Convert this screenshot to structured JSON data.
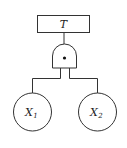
{
  "diagram": {
    "type": "fault-tree",
    "top_event": {
      "label": "T"
    },
    "gate": {
      "type": "AND",
      "symbol": "•"
    },
    "basic_events": [
      {
        "label": "X",
        "subscript": "1"
      },
      {
        "label": "X",
        "subscript": "2"
      }
    ],
    "colors": {
      "stroke": "#333333",
      "background": "#ffffff",
      "text": "#222222"
    }
  }
}
